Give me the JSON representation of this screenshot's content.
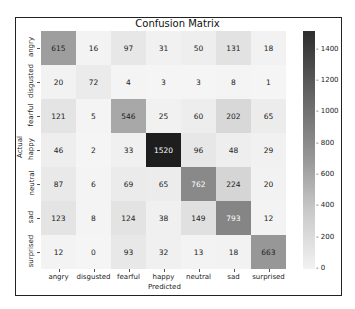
{
  "chart_data": {
    "type": "heatmap",
    "title": "Confusion Matrix",
    "xlabel": "Predicted",
    "ylabel": "Actual",
    "x_categories": [
      "angry",
      "disgusted",
      "fearful",
      "happy",
      "neutral",
      "sad",
      "surprised"
    ],
    "y_categories": [
      "angry",
      "disgusted",
      "fearful",
      "happy",
      "neutral",
      "sad",
      "surprised"
    ],
    "matrix": [
      [
        615,
        16,
        97,
        31,
        50,
        131,
        18
      ],
      [
        20,
        72,
        4,
        3,
        3,
        8,
        1
      ],
      [
        121,
        5,
        546,
        25,
        60,
        202,
        65
      ],
      [
        46,
        2,
        33,
        1520,
        96,
        48,
        29
      ],
      [
        87,
        6,
        69,
        65,
        762,
        224,
        20
      ],
      [
        123,
        8,
        124,
        38,
        149,
        793,
        12
      ],
      [
        12,
        0,
        93,
        32,
        13,
        18,
        663
      ]
    ],
    "colorbar": {
      "min": 0,
      "max": 1520,
      "ticks": [
        0,
        200,
        400,
        600,
        800,
        1000,
        1200,
        1400
      ]
    },
    "colormap": "Greys"
  }
}
